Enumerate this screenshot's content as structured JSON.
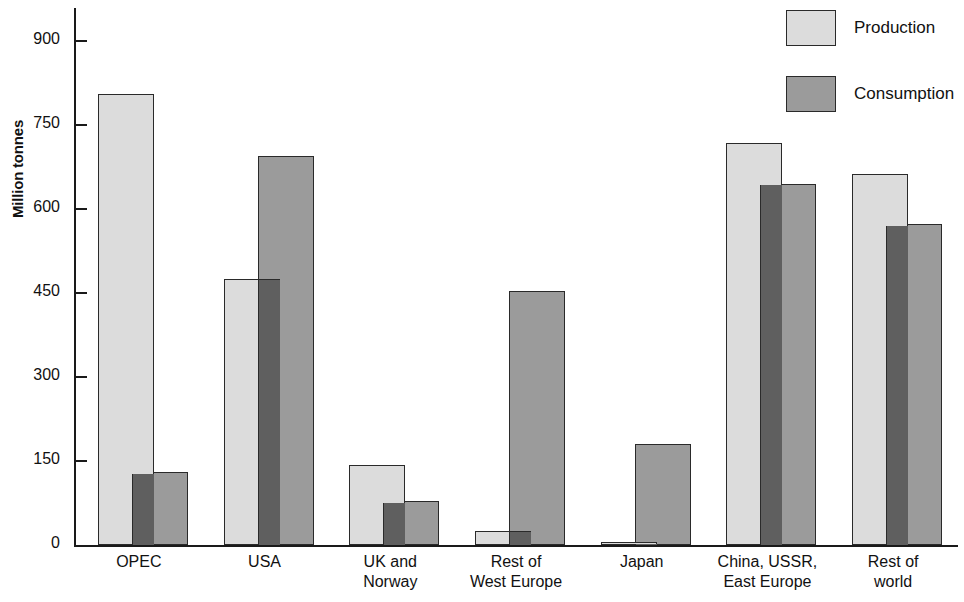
{
  "chart_data": {
    "type": "bar",
    "title": "",
    "xlabel": "",
    "ylabel": "Million tonnes",
    "ylim": [
      0,
      960
    ],
    "yticks": [
      0,
      150,
      300,
      450,
      600,
      750,
      900
    ],
    "ytick_labels": [
      "0",
      "150",
      "300",
      "450",
      "600",
      "750",
      "900"
    ],
    "grid": false,
    "legend_position": "top-right",
    "categories": [
      "OPEC",
      "USA",
      "UK and\nNorway",
      "Rest of\nWest Europe",
      "Japan",
      "China, USSR,\nEast Europe",
      "Rest of\nworld"
    ],
    "series": [
      {
        "name": "Production",
        "color": "#dcdcdc",
        "values": [
          805,
          475,
          143,
          25,
          5,
          718,
          663
        ]
      },
      {
        "name": "Consumption",
        "color": "#9b9b9b",
        "values": [
          130,
          695,
          78,
          453,
          180,
          645,
          573
        ]
      }
    ]
  },
  "legend": {
    "items": [
      {
        "label": "Production",
        "swatch": "light-gray-swatch"
      },
      {
        "label": "Consumption",
        "swatch": "dark-gray-swatch"
      }
    ]
  },
  "axes": {
    "y_title": "Million tonnes"
  }
}
